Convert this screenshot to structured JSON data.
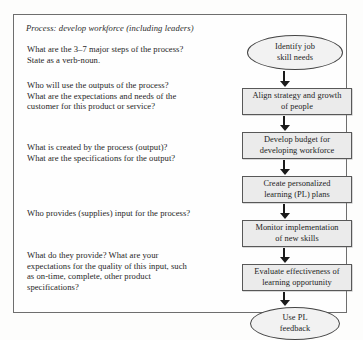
{
  "panel": {
    "heading": "Process: develop workforce (including leaders)",
    "questions": [
      {
        "id": "major-steps",
        "lines": [
          "What are the 3–7 major steps of the process?",
          "State as a verb-noun."
        ]
      },
      {
        "id": "outputs-customer",
        "lines": [
          "Who will use the outputs of the process?",
          "What are the expectations and needs of the",
          "customer for this product or service?"
        ]
      },
      {
        "id": "output-specs",
        "lines": [
          "What is created by the process (output)?",
          "What are the specifications for the output?"
        ]
      },
      {
        "id": "suppliers",
        "lines": [
          "Who provides (supplies) input for the process?"
        ]
      },
      {
        "id": "input-quality",
        "lines": [
          "What do they provide? What are your",
          "expectations for the quality of this input, such",
          "as on-time, complete, other product",
          "specifications?"
        ]
      }
    ]
  },
  "flowchart": {
    "type": "vertical-process-flow",
    "nodes": [
      {
        "id": "identify-job-skill-needs",
        "shape": "terminator",
        "lines": [
          "Identify job",
          "skill needs"
        ]
      },
      {
        "id": "align-strategy-growth",
        "shape": "box",
        "lines": [
          "Align strategy and growth",
          "of people"
        ]
      },
      {
        "id": "develop-budget",
        "shape": "box",
        "lines": [
          "Develop budget for",
          "developing workforce"
        ]
      },
      {
        "id": "create-pl-plans",
        "shape": "box",
        "lines": [
          "Create personalized",
          "learning (PL) plans"
        ]
      },
      {
        "id": "monitor-implementation",
        "shape": "box",
        "lines": [
          "Monitor implementation",
          "of new skills"
        ]
      },
      {
        "id": "evaluate-effectiveness",
        "shape": "box",
        "lines": [
          "Evaluate effectiveness of",
          "learning opportunity"
        ]
      },
      {
        "id": "use-pl-feedback",
        "shape": "terminator",
        "lines": [
          "Use PL",
          "feedback"
        ]
      }
    ],
    "connector_count": 6,
    "connector_direction": "down"
  },
  "colors": {
    "page_background": "#fdfdfc",
    "panel_border": "#6e6e6e",
    "box_fill": "#ebebeb",
    "box_border": "#585858",
    "terminator_fill": "#f2f2f2",
    "terminator_border": "#454545",
    "arrow": "#1a1a1a",
    "text": "#262626"
  }
}
